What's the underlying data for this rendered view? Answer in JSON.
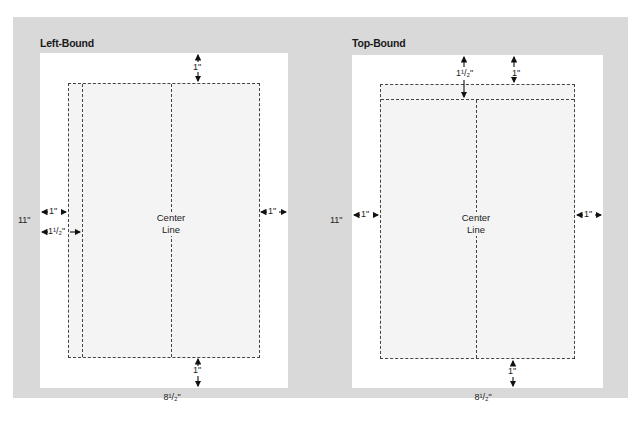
{
  "panels": {
    "left": {
      "title": "Left-Bound",
      "center_label_line1": "Center",
      "center_label_line2": "Line",
      "height_label": "11\"",
      "width_label": "8¹/₂\"",
      "top_margin": "1\"",
      "bottom_margin": "1\"",
      "left_margin": "1\"",
      "left_binding_margin": "1¹/₂\"",
      "right_margin": "1\""
    },
    "right": {
      "title": "Top-Bound",
      "center_label_line1": "Center",
      "center_label_line2": "Line",
      "height_label": "11\"",
      "width_label": "8¹/₂\"",
      "top_binding_margin": "1¹/₂\"",
      "top_margin": "1\"",
      "bottom_margin": "1\"",
      "left_margin": "1\"",
      "right_margin": "1\""
    }
  },
  "colors": {
    "background": "#d9d9d9",
    "page": "#ffffff",
    "text_area": "#f4f4f4",
    "lines": "#444444"
  }
}
